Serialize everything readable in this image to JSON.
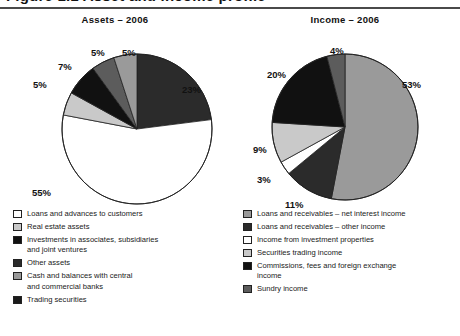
{
  "document": {
    "cut_off_heading": "Figure 1.1  Asset and income profile",
    "colors": {
      "white": "#ffffff",
      "light_gray": "#c9c9c9",
      "mid_gray": "#9a9a9a",
      "dark_gray": "#5c5c5c",
      "near_black": "#2b2b2b",
      "black": "#111111",
      "outline": "#222222",
      "rule": "#4a4a4a"
    }
  },
  "charts": [
    {
      "id": "assets-2006",
      "title": "Assets – 2006",
      "type": "pie",
      "labels_suffix": "%",
      "slices": [
        {
          "label": "Investments in associates, subsidiaries and joint ventures",
          "value": 23,
          "display": "23%",
          "color": "#2b2b2b"
        },
        {
          "label": "Loans and advances to customers",
          "value": 55,
          "display": "55%",
          "color": "#ffffff"
        },
        {
          "label": "Real estate assets",
          "value": 5,
          "display": "5%",
          "color": "#c9c9c9"
        },
        {
          "label": "Other assets",
          "value": 7,
          "display": "7%",
          "color": "#111111"
        },
        {
          "label": "Trading securities",
          "value": 5,
          "display": "5%",
          "color": "#5c5c5c"
        },
        {
          "label": "Cash and balances with central and commercial banks",
          "value": 5,
          "display": "5%",
          "color": "#9a9a9a"
        }
      ],
      "legend": [
        {
          "label": "Loans and advances to customers",
          "color": "#ffffff"
        },
        {
          "label": "Real estate assets",
          "color": "#c9c9c9"
        },
        {
          "label": "Investments in associates, subsidiaries\nand joint ventures",
          "color": "#111111"
        },
        {
          "label": "Other assets",
          "color": "#2b2b2b"
        },
        {
          "label": "Cash and balances with central\nand commercial banks",
          "color": "#9a9a9a"
        },
        {
          "label": "Trading securities",
          "color": "#1a1a1a"
        }
      ]
    },
    {
      "id": "income-2006",
      "title": "Income – 2006",
      "type": "pie",
      "labels_suffix": "%",
      "slices": [
        {
          "label": "Loans and receivables – net interest income",
          "value": 53,
          "display": "53%",
          "color": "#9a9a9a"
        },
        {
          "label": "Loans and receivables – other income",
          "value": 11,
          "display": "11%",
          "color": "#2b2b2b"
        },
        {
          "label": "Income from investment properties",
          "value": 3,
          "display": "3%",
          "color": "#ffffff"
        },
        {
          "label": "Securities trading income",
          "value": 9,
          "display": "9%",
          "color": "#c9c9c9"
        },
        {
          "label": "Commissions, fees and foreign exchange income",
          "value": 20,
          "display": "20%",
          "color": "#111111"
        },
        {
          "label": "Sundry income",
          "value": 4,
          "display": "4%",
          "color": "#5c5c5c"
        }
      ],
      "legend": [
        {
          "label": "Loans and receivables – net interest income",
          "color": "#9a9a9a"
        },
        {
          "label": "Loans and receivables – other income",
          "color": "#2b2b2b"
        },
        {
          "label": "Income from investment properties",
          "color": "#ffffff"
        },
        {
          "label": "Securities trading income",
          "color": "#c9c9c9"
        },
        {
          "label": "Commissions, fees and foreign exchange\nincome",
          "color": "#111111"
        },
        {
          "label": "Sundry income",
          "color": "#5c5c5c"
        }
      ]
    }
  ],
  "chart_data": [
    {
      "type": "pie",
      "title": "Assets – 2006",
      "categories": [
        "Loans and advances to customers",
        "Investments in associates, subsidiaries and joint ventures",
        "Other assets",
        "Real estate assets",
        "Cash and balances with central and commercial banks",
        "Trading securities"
      ],
      "values": [
        55,
        23,
        7,
        5,
        5,
        5
      ],
      "value_labels": [
        "55%",
        "23%",
        "7%",
        "5%",
        "5%",
        "5%"
      ],
      "unit": "percent",
      "legend_position": "below",
      "grid": false
    },
    {
      "type": "pie",
      "title": "Income – 2006",
      "categories": [
        "Loans and receivables – net interest income",
        "Commissions, fees and foreign exchange income",
        "Loans and receivables – other income",
        "Securities trading income",
        "Sundry income",
        "Income from investment properties"
      ],
      "values": [
        53,
        20,
        11,
        9,
        4,
        3
      ],
      "value_labels": [
        "53%",
        "20%",
        "11%",
        "9%",
        "4%",
        "3%"
      ],
      "unit": "percent",
      "legend_position": "below",
      "grid": false
    }
  ],
  "callouts": {
    "assets": [
      {
        "text": "5%",
        "x": 91,
        "y": 38
      },
      {
        "text": "5%",
        "x": 122,
        "y": 38
      },
      {
        "text": "7%",
        "x": 58,
        "y": 52
      },
      {
        "text": "5%",
        "x": 33,
        "y": 70
      },
      {
        "text": "23%",
        "x": 182,
        "y": 75
      },
      {
        "text": "55%",
        "x": 32,
        "y": 178
      }
    ],
    "income": [
      {
        "text": "4%",
        "x": 100,
        "y": 36
      },
      {
        "text": "53%",
        "x": 172,
        "y": 70
      },
      {
        "text": "20%",
        "x": 37,
        "y": 60
      },
      {
        "text": "9%",
        "x": 23,
        "y": 135
      },
      {
        "text": "3%",
        "x": 27,
        "y": 165
      },
      {
        "text": "11%",
        "x": 55,
        "y": 190
      }
    ]
  }
}
